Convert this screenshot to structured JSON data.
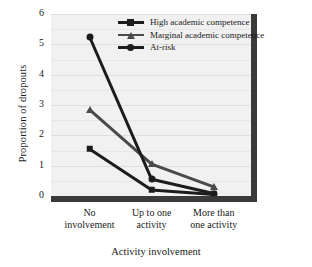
{
  "chart_data": {
    "type": "line",
    "title": "",
    "xlabel": "Activity involvement",
    "ylabel": "Proportion of dropouts",
    "categories": [
      "No involvement",
      "Up to one activity",
      "More than one activity"
    ],
    "category_lines": [
      [
        "No",
        "involvement"
      ],
      [
        "Up to one",
        "activity"
      ],
      [
        "More than",
        "one activity"
      ]
    ],
    "ylim": [
      0,
      6
    ],
    "yticks": [
      0,
      1,
      2,
      3,
      4,
      5,
      6
    ],
    "ytick_labels": [
      "0",
      "1",
      "2",
      "3",
      "4",
      "5",
      "6"
    ],
    "grid": true,
    "legend_position": "top-center",
    "series": [
      {
        "name": "High academic competence",
        "marker": "square",
        "color": "#1c1c1c",
        "values": [
          1.55,
          0.2,
          0.05
        ]
      },
      {
        "name": "Marginal academic competence",
        "marker": "triangle",
        "color": "#4a4a4a",
        "values": [
          2.85,
          1.05,
          0.3
        ]
      },
      {
        "name": "At-risk",
        "marker": "circle",
        "color": "#1c1c1c",
        "values": [
          5.25,
          0.55,
          0.08
        ]
      }
    ]
  },
  "colors": {
    "plot_background": "#f1f1f1",
    "axis": "#3a3a3a",
    "gridline": "#e6e6e6",
    "series_dark": "#1c1c1c",
    "series_gray": "#4a4a4a"
  }
}
